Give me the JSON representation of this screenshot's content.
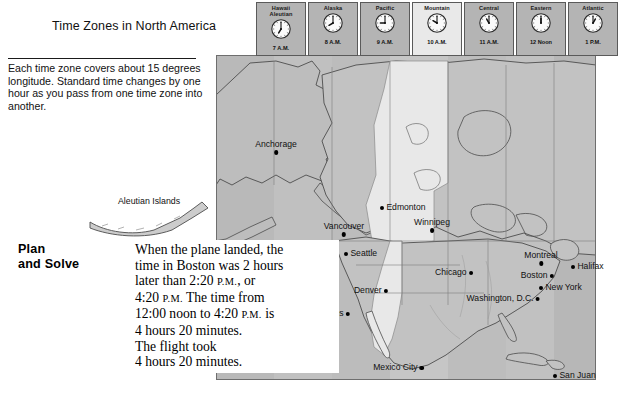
{
  "page": {
    "title": "Time Zones in North America",
    "note": "Each time zone covers about\n15 degrees longitude.\nStandard time changes by\none hour as you pass from\none time zone into another."
  },
  "plan": {
    "label": "Plan\nand Solve",
    "line1": "When the plane landed, the",
    "line2": "time in Boston was 2 hours",
    "line3a": "later than 2:20 ",
    "line3b": "P.M.",
    "line3c": ", or",
    "line4a": "4:20 ",
    "line4b": "P.M.",
    "line4c": " The time from",
    "line5a": "12:00 noon to 4:20 ",
    "line5b": "P.M.",
    "line5c": " is",
    "line6": "4 hours 20 minutes.",
    "line7": "The flight took",
    "line8": "4 hours 20 minutes."
  },
  "timezones": [
    {
      "name": "Hawaii\nAleutian",
      "time": "7 A.M.",
      "hour": 7,
      "minute": 0,
      "light": false
    },
    {
      "name": "Alaska",
      "time": "8 A.M.",
      "hour": 8,
      "minute": 0,
      "light": false
    },
    {
      "name": "Pacific",
      "time": "9 A.M.",
      "hour": 9,
      "minute": 0,
      "light": false
    },
    {
      "name": "Mountain",
      "time": "10 A.M.",
      "hour": 10,
      "minute": 0,
      "light": true
    },
    {
      "name": "Central",
      "time": "11 A.M.",
      "hour": 11,
      "minute": 0,
      "light": false
    },
    {
      "name": "Eastern",
      "time": "12 Noon",
      "hour": 12,
      "minute": 0,
      "light": false
    },
    {
      "name": "Atlantic",
      "time": "1 P.M.",
      "hour": 1,
      "minute": 0,
      "light": false
    }
  ],
  "map": {
    "aleutian_label": "Aleutian Islands",
    "cities": [
      {
        "name": "Anchorage",
        "x": 60,
        "y": 85,
        "side": "below"
      },
      {
        "name": "Edmonton",
        "x": 166,
        "y": 148,
        "side": "right"
      },
      {
        "name": "Vancouver",
        "x": 128,
        "y": 167,
        "side": "below"
      },
      {
        "name": "Winnipeg",
        "x": 216,
        "y": 163,
        "side": "below"
      },
      {
        "name": "Seattle",
        "x": 130,
        "y": 194,
        "side": "right"
      },
      {
        "name": "Montreal",
        "x": 325,
        "y": 196,
        "side": "below"
      },
      {
        "name": "Halifax",
        "x": 357,
        "y": 207,
        "side": "right"
      },
      {
        "name": "Chicago",
        "x": 251,
        "y": 213,
        "side": "left"
      },
      {
        "name": "Boston",
        "x": 332,
        "y": 216,
        "side": "left"
      },
      {
        "name": "New York",
        "x": 325,
        "y": 228,
        "side": "right"
      },
      {
        "name": "Denver",
        "x": 166,
        "y": 231,
        "side": "left"
      },
      {
        "name": "Washington, D.C.",
        "x": 318,
        "y": 239,
        "side": "left"
      },
      {
        "name": "Los Angeles",
        "x": 128,
        "y": 254,
        "side": "left"
      },
      {
        "name": "Mexico City",
        "x": 202,
        "y": 308,
        "side": "left"
      },
      {
        "name": "San Juan",
        "x": 339,
        "y": 316,
        "side": "right"
      }
    ],
    "zone_bands": [
      {
        "left": 0,
        "width": 58,
        "shade": "#b9b9b9"
      },
      {
        "left": 58,
        "width": 58,
        "shade": "#c0c0c0"
      },
      {
        "left": 116,
        "width": 58,
        "shade": "#bcbcbc"
      },
      {
        "left": 174,
        "width": 58,
        "shade": "#c6c6c6"
      },
      {
        "left": 232,
        "width": 58,
        "shade": "#bdbdbd"
      },
      {
        "left": 290,
        "width": 48,
        "shade": "#c1c1c1"
      },
      {
        "left": 338,
        "width": 42,
        "shade": "#b7b7b7"
      }
    ]
  },
  "colors": {
    "land_light": "#e6e6e6",
    "land_dark": "#b5b5b5",
    "outline": "#5a5a5a",
    "text": "#111111"
  }
}
